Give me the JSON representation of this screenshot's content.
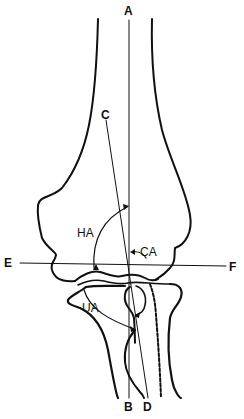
{
  "diagram": {
    "labels": {
      "A": "A",
      "B": "B",
      "C": "C",
      "D": "D",
      "E": "E",
      "F": "F",
      "HA": "HA",
      "CA": "CA",
      "UA": "UA"
    },
    "colors": {
      "line": "#111111",
      "background": "#ffffff"
    }
  }
}
